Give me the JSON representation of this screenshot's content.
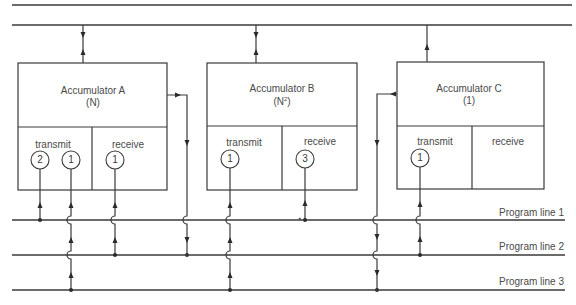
{
  "diagram": {
    "accumulators": [
      {
        "name": "Accumulator A",
        "param": "(N)",
        "transmit_label": "transmit",
        "receive_label": "receive",
        "transmit_programs": [
          "2",
          "1"
        ],
        "receive_programs": [
          "1"
        ]
      },
      {
        "name": "Accumulator B",
        "param_base": "(N",
        "param_sup": "2",
        "param_close": ")",
        "transmit_label": "transmit",
        "receive_label": "receive",
        "transmit_programs": [
          "1"
        ],
        "receive_programs": [
          "3"
        ]
      },
      {
        "name": "Accumulator C",
        "param": "(1)",
        "transmit_label": "transmit",
        "receive_label": "receive",
        "transmit_programs": [
          "1"
        ],
        "receive_programs": []
      }
    ],
    "program_lines": [
      "Program line 1",
      "Program line 2",
      "Program line 3"
    ],
    "colors": {
      "line": "#3a3a3a",
      "text": "#4a4a4a",
      "background": "#ffffff"
    }
  }
}
